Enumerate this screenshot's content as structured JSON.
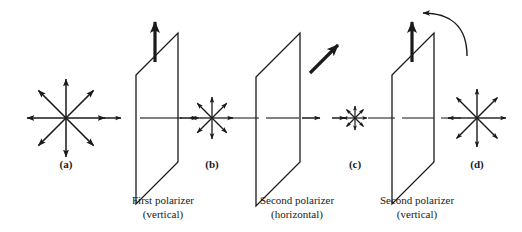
{
  "figure": {
    "background_color": "#ffffff",
    "stroke_color": "#1a1a1a",
    "dashed_axis_color": "#555555",
    "width": 522,
    "height": 232,
    "axis_y": 118
  },
  "panels": [
    {
      "id": "a",
      "label": "(a)",
      "label_x": 66,
      "label_y": 158,
      "star": {
        "name": "unpolarized-light-star",
        "cx": 66,
        "cy": 118,
        "radius": 40,
        "rays": 8,
        "description": "Unpolarized light: equal amplitude in all directions"
      }
    },
    {
      "id": "b",
      "label": "(b)",
      "label_x": 212,
      "label_y": 158,
      "star": {
        "name": "polarized-light-star-b",
        "cx": 212,
        "cy": 118,
        "radius": 22,
        "rays": 8,
        "description": "Light after first vertical polarizer"
      }
    },
    {
      "id": "c",
      "label": "(c)",
      "label_x": 355,
      "label_y": 158,
      "star": {
        "name": "polarized-light-star-c",
        "cx": 355,
        "cy": 118,
        "radius": 13,
        "rays": 8,
        "description": "Light after second horizontal polarizer"
      }
    },
    {
      "id": "d",
      "label": "(d)",
      "label_x": 477,
      "label_y": 158,
      "star": {
        "name": "polarized-light-star-d",
        "cx": 477,
        "cy": 118,
        "radius": 30,
        "rays": 8,
        "description": "Light after second vertical polarizer"
      }
    }
  ],
  "polarizers": [
    {
      "id": "first",
      "name": "first-polarizer",
      "caption_line1": "First polarizer",
      "caption_line2": "(vertical)",
      "caption_x": 163,
      "caption_y": 193,
      "axis_arrow": "vertical-up",
      "plate": {
        "left_x": 136,
        "right_x": 178,
        "top_y": 32,
        "bottom_y": 204,
        "slant": 42
      }
    },
    {
      "id": "second-horizontal",
      "name": "second-polarizer-horizontal",
      "caption_line1": "Second polarizer",
      "caption_line2": "(horizontal)",
      "caption_x": 297,
      "caption_y": 193,
      "axis_arrow": "diagonal-up-right",
      "plate": {
        "left_x": 256,
        "right_x": 300,
        "top_y": 32,
        "bottom_y": 204,
        "slant": 44
      }
    },
    {
      "id": "second-vertical",
      "name": "second-polarizer-vertical",
      "caption_line1": "Second polarizer",
      "caption_line2": "(vertical)",
      "caption_x": 417,
      "caption_y": 193,
      "axis_arrow": "vertical-up",
      "rotation_arrow": "counterclockwise-curved-arrow",
      "plate": {
        "left_x": 392,
        "right_x": 434,
        "top_y": 32,
        "bottom_y": 204,
        "slant": 42
      }
    }
  ],
  "beam_arrows": [
    {
      "name": "beam-arrow-1",
      "x1": 104,
      "x2": 120
    },
    {
      "name": "beam-arrow-2",
      "x1": 180,
      "x2": 196
    },
    {
      "name": "beam-arrow-3",
      "x1": 302,
      "x2": 318
    },
    {
      "name": "beam-arrow-4",
      "x1": 336,
      "x2": 344
    }
  ],
  "axis_dashes": [
    {
      "x1": 140,
      "x2": 182
    },
    {
      "x1": 190,
      "x2": 200
    },
    {
      "x1": 228,
      "x2": 260
    },
    {
      "x1": 264,
      "x2": 300
    },
    {
      "x1": 368,
      "x2": 396
    },
    {
      "x1": 400,
      "x2": 436
    },
    {
      "x1": 440,
      "x2": 462
    }
  ]
}
